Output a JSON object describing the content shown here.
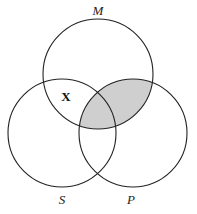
{
  "diagram": {
    "type": "venn-3-circle",
    "circles": [
      {
        "id": "M",
        "label": "M",
        "cx": 98,
        "cy": 74,
        "r": 55
      },
      {
        "id": "S",
        "label": "S",
        "cx": 62,
        "cy": 133,
        "r": 54
      },
      {
        "id": "P",
        "label": "P",
        "cx": 133,
        "cy": 133,
        "r": 54
      }
    ],
    "shaded_region": "M∩P",
    "shade_color": "#cfcfcf",
    "stroke_color": "#222222",
    "marks": [
      {
        "text": "X",
        "region": "M∩S only"
      }
    ]
  },
  "labels": {
    "M": "M",
    "S": "S",
    "P": "P",
    "X": "X"
  }
}
